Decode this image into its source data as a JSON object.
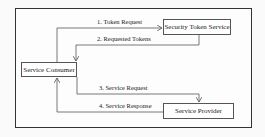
{
  "diagram": {
    "nodes": {
      "consumer": "Service Consumer",
      "sts": "Security Token Service",
      "provider": "Service Provider"
    },
    "edges": [
      {
        "label": "1. Token Request",
        "from": "Service Consumer",
        "to": "Security Token Service"
      },
      {
        "label": "2. Requested Tokens",
        "from": "Security Token Service",
        "to": "Service Consumer"
      },
      {
        "label": "3. Service Request",
        "from": "Service Consumer",
        "to": "Service Provider"
      },
      {
        "label": "4. Service Response",
        "from": "Service Provider",
        "to": "Service Consumer"
      }
    ],
    "colors": {
      "line": "#555555",
      "text": "#222222",
      "background": "#fafafa"
    }
  }
}
